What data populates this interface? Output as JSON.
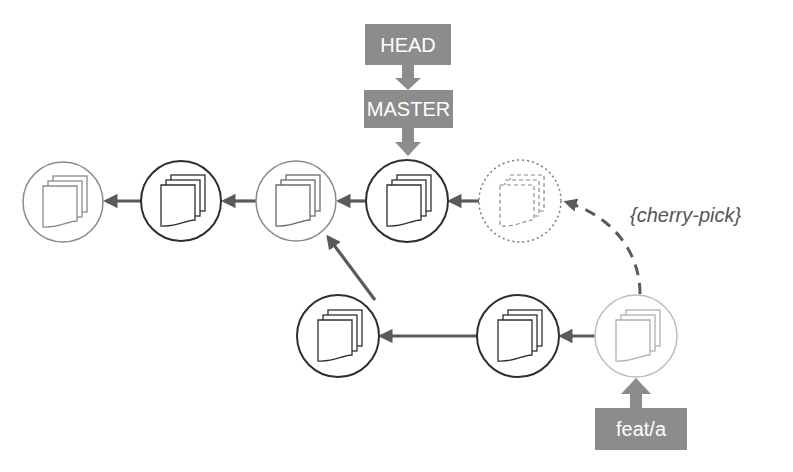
{
  "diagram": {
    "colors": {
      "ref_box": "#8c8c8c",
      "arrow": "#5a5a5a",
      "node_dark": "#2e2e2e",
      "node_light": "#8a8a8a",
      "node_faint": "#bdbdbd"
    },
    "refs": {
      "head": {
        "label": "HEAD"
      },
      "master": {
        "label": "MASTER"
      },
      "feature": {
        "label": "feat/a"
      }
    },
    "annotation": {
      "label": "{cherry-pick}"
    },
    "main_line": [
      {
        "id": "c1",
        "style": "light",
        "icon": "file-stack-icon"
      },
      {
        "id": "c2",
        "style": "dark",
        "icon": "file-stack-icon"
      },
      {
        "id": "c3",
        "style": "light",
        "icon": "file-stack-icon"
      },
      {
        "id": "c4",
        "style": "dark",
        "icon": "file-stack-icon",
        "ref": "MASTER"
      },
      {
        "id": "c5",
        "style": "dotted",
        "icon": "file-stack-icon",
        "note": "cherry-picked copy"
      }
    ],
    "branch_line": [
      {
        "id": "b1",
        "style": "dark",
        "icon": "file-stack-icon",
        "parent": "c3"
      },
      {
        "id": "b2",
        "style": "dark",
        "icon": "file-stack-icon",
        "parent": "b1"
      },
      {
        "id": "b3",
        "style": "faint",
        "icon": "file-stack-icon",
        "parent": "b2",
        "ref": "feat/a"
      }
    ]
  }
}
